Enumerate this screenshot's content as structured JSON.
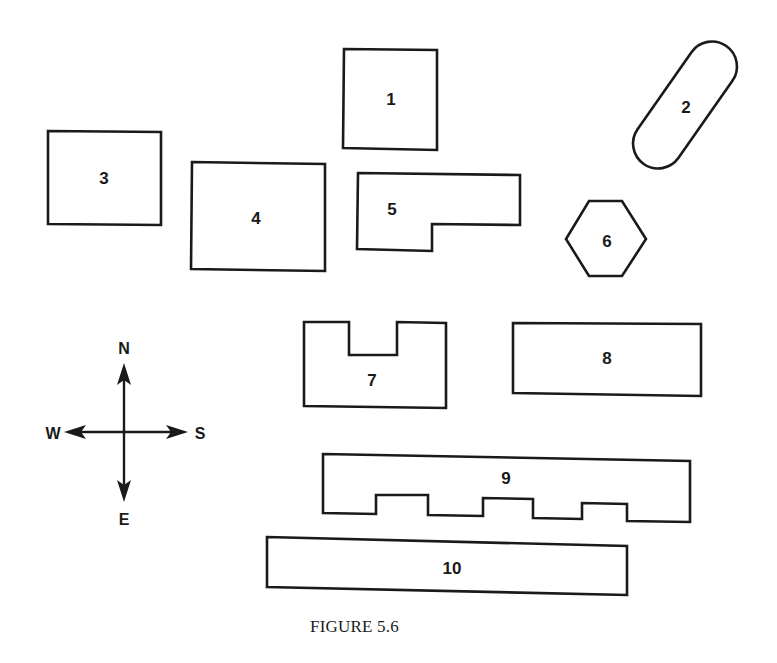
{
  "figure": {
    "caption": "FIGURE 5.6",
    "stroke_color": "#1a1a1a",
    "background_color": "#ffffff"
  },
  "shapes": [
    {
      "id": 1,
      "label": "1",
      "kind": "rectangle"
    },
    {
      "id": 2,
      "label": "2",
      "kind": "rotated-capsule"
    },
    {
      "id": 3,
      "label": "3",
      "kind": "rectangle"
    },
    {
      "id": 4,
      "label": "4",
      "kind": "rectangle"
    },
    {
      "id": 5,
      "label": "5",
      "kind": "L-shape"
    },
    {
      "id": 6,
      "label": "6",
      "kind": "hexagon"
    },
    {
      "id": 7,
      "label": "7",
      "kind": "U-shape"
    },
    {
      "id": 8,
      "label": "8",
      "kind": "rectangle"
    },
    {
      "id": 9,
      "label": "9",
      "kind": "comb-shape"
    },
    {
      "id": 10,
      "label": "10",
      "kind": "long-rectangle"
    }
  ],
  "compass": {
    "top": "N",
    "left": "W",
    "right": "S",
    "bottom": "E"
  }
}
